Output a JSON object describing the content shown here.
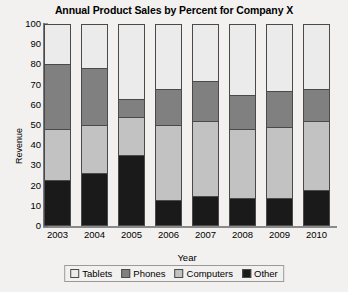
{
  "chart_data": {
    "type": "bar",
    "title": "Annual Product Sales by Percent for Company X",
    "xlabel": "Year",
    "ylabel": "Revenue",
    "stacked": true,
    "grid": false,
    "legend_position": "bottom",
    "ylim": [
      0,
      100
    ],
    "yticks": [
      0,
      10,
      20,
      30,
      40,
      50,
      60,
      70,
      80,
      90,
      100
    ],
    "categories": [
      "2003",
      "2004",
      "2005",
      "2006",
      "2007",
      "2008",
      "2009",
      "2010"
    ],
    "series": [
      {
        "name": "Other",
        "color": "#1a1a1a",
        "values": [
          23,
          26,
          35,
          13,
          15,
          14,
          14,
          18
        ]
      },
      {
        "name": "Computers",
        "color": "#c2c2c2",
        "values": [
          25,
          24,
          19,
          37,
          37,
          34,
          35,
          34
        ]
      },
      {
        "name": "Phones",
        "color": "#808080",
        "values": [
          32,
          28,
          9,
          18,
          20,
          17,
          18,
          16
        ]
      },
      {
        "name": "Tablets",
        "color": "#ebebeb",
        "values": [
          20,
          22,
          37,
          32,
          28,
          35,
          33,
          32
        ]
      }
    ],
    "stack_tops": {
      "Other": [
        23,
        26,
        35,
        13,
        15,
        14,
        14,
        18
      ],
      "Computers": [
        48,
        50,
        54,
        50,
        52,
        48,
        49,
        52
      ],
      "Phones": [
        80,
        78,
        63,
        68,
        72,
        65,
        67,
        68
      ],
      "Tablets": [
        100,
        100,
        100,
        100,
        100,
        100,
        100,
        100
      ]
    }
  },
  "legend": {
    "items": [
      {
        "label": "Tablets",
        "color": "#ebebeb"
      },
      {
        "label": "Phones",
        "color": "#808080"
      },
      {
        "label": "Computers",
        "color": "#c2c2c2"
      },
      {
        "label": "Other",
        "color": "#1a1a1a"
      }
    ]
  }
}
